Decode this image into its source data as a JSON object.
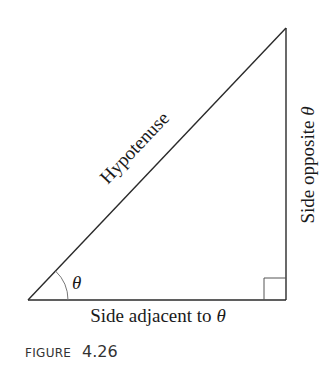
{
  "figure": {
    "caption_label": "FIGURE",
    "caption_number": "4.26",
    "labels": {
      "hypotenuse": "Hypotenuse",
      "opposite": "Side opposite θ",
      "adjacent": "Side adjacent to θ",
      "angle": "θ"
    },
    "triangle": {
      "vertices": {
        "angle_vertex": [
          28,
          300
        ],
        "right_angle_vertex": [
          286,
          300
        ],
        "top_vertex": [
          286,
          28
        ]
      },
      "right_angle_marker_size": 22,
      "angle_arc_radius": 40
    },
    "colors": {
      "line": "#2a2a2a",
      "arc": "#777777",
      "text": "#1a1a1a",
      "caption": "#333333"
    }
  }
}
